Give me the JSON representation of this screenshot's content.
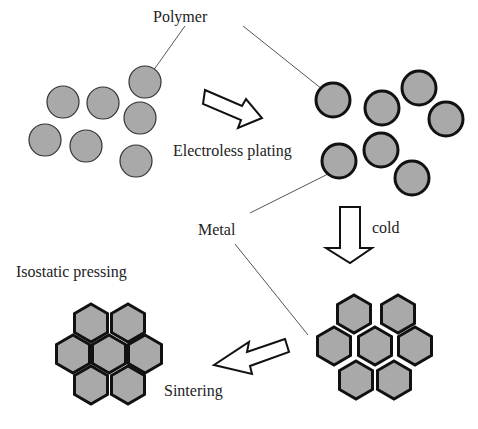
{
  "labels": {
    "polymer": "Polymer",
    "electroless": "Electroless plating",
    "metal": "Metal",
    "cold": "cold",
    "isostatic": "Isostatic pressing",
    "sintering": "Sintering"
  },
  "colors": {
    "fill": "#a9a9a9",
    "stroke": "#111111",
    "line": "#555555"
  }
}
